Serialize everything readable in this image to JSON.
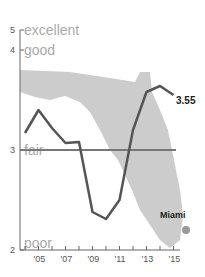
{
  "chart_data": {
    "type": "line",
    "title": "",
    "xlabel": "",
    "ylabel": "",
    "x": [
      2004,
      2005,
      2006,
      2007,
      2008,
      2009,
      2010,
      2011,
      2012,
      2013,
      2014,
      2015
    ],
    "x_tick_labels": [
      "'05",
      "'07",
      "'09",
      "'11",
      "'13",
      "'15"
    ],
    "y_ticks": [
      2,
      3,
      4,
      5
    ],
    "y_tick_labels": [
      "2",
      "3",
      "4",
      "5"
    ],
    "y_category_labels": [
      "poor",
      "fair",
      "good",
      "excellent"
    ],
    "ylim": [
      2,
      5
    ],
    "series": [
      {
        "name": "Florida",
        "values": [
          3.17,
          3.4,
          3.22,
          3.07,
          3.08,
          2.38,
          2.31,
          2.5,
          3.2,
          3.58,
          3.64,
          3.55
        ]
      }
    ],
    "reference_line": {
      "value": 3,
      "label": "fair"
    },
    "annotations": [
      {
        "text": "3.55",
        "target": "last point"
      },
      {
        "text": "Miami",
        "target": "map marker"
      }
    ],
    "grid": false,
    "legend": "none"
  },
  "colors": {
    "line": "#555555",
    "reference": "#777777",
    "map": "#c8c8c8",
    "marker": "#999999",
    "label": "#aaaaaa"
  }
}
